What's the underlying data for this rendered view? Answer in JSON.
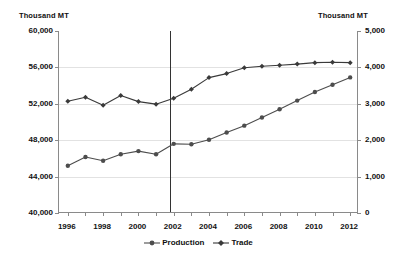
{
  "axes": {
    "left_unit_label": "Thousand MT",
    "right_unit_label": "Thousand MT",
    "left_ticks": [
      "60,000",
      "56,000",
      "52,000",
      "48,000",
      "44,000",
      "40,000"
    ],
    "right_ticks": [
      "5,000",
      "4,000",
      "3,000",
      "2,000",
      "1,000",
      "0"
    ],
    "x_ticks": [
      "1996",
      "1998",
      "2000",
      "2002",
      "2004",
      "2006",
      "2008",
      "2010",
      "2012"
    ]
  },
  "legend": {
    "items": [
      {
        "label": "Production",
        "marker": "circle-marker-icon",
        "color": "#4d4d4d"
      },
      {
        "label": "Trade",
        "marker": "diamond-marker-icon",
        "color": "#3a3a3a"
      }
    ]
  },
  "chart_data": {
    "type": "line",
    "title": "",
    "xlabel": "",
    "ylabel": "Thousand MT",
    "y2label": "Thousand MT",
    "x": [
      1996,
      1997,
      1998,
      1999,
      2000,
      2001,
      2002,
      2003,
      2004,
      2005,
      2006,
      2007,
      2008,
      2009,
      2010,
      2011,
      2012
    ],
    "xlim": [
      1995.5,
      2012.5
    ],
    "ylim": [
      40000,
      60000
    ],
    "y2lim": [
      0,
      5000
    ],
    "grid": true,
    "legend_position": "bottom",
    "annotations": [
      {
        "type": "vline",
        "x": 2001.8,
        "label": ""
      }
    ],
    "series": [
      {
        "name": "Production",
        "axis": "left",
        "marker": "circle",
        "color": "#4d4d4d",
        "values": [
          45200,
          46150,
          45750,
          46450,
          46800,
          46450,
          47600,
          47550,
          48050,
          48850,
          49600,
          50500,
          51400,
          52350,
          53300,
          54100,
          54900
        ]
      },
      {
        "name": "Trade",
        "axis": "right",
        "marker": "diamond",
        "color": "#3a3a3a",
        "values": [
          3070,
          3180,
          2960,
          3230,
          3060,
          2990,
          3150,
          3400,
          3720,
          3830,
          3990,
          4030,
          4060,
          4090,
          4130,
          4140,
          4130
        ]
      }
    ]
  }
}
